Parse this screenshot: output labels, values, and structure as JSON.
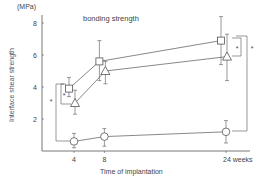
{
  "chart_data": {
    "type": "line",
    "title": "bonding strength",
    "xlabel": "Time of implantation",
    "ylabel": "Interface shear strength",
    "yunit": "(MPa)",
    "x": [
      4,
      8,
      24
    ],
    "x_tick_labels": [
      "4",
      "8",
      "24 weeks"
    ],
    "y_ticks": [
      2,
      4,
      6,
      8
    ],
    "ylim": [
      0,
      9
    ],
    "grid": false,
    "legend": "none (series distinguished by markers)",
    "series": [
      {
        "name": "square-marker",
        "marker": "square",
        "values": [
          3.9,
          5.6,
          6.9
        ],
        "err_hi": [
          4.6,
          6.9,
          8.4
        ],
        "err_lo": [
          3.4,
          4.4,
          5.4
        ]
      },
      {
        "name": "triangle-marker",
        "marker": "triangle",
        "values": [
          3.0,
          5.0,
          5.9
        ],
        "err_hi": [
          3.8,
          5.6,
          7.3
        ],
        "err_lo": [
          2.3,
          4.2,
          4.4
        ]
      },
      {
        "name": "circle-marker",
        "marker": "circle",
        "values": [
          0.6,
          0.9,
          1.2
        ],
        "err_hi": [
          1.1,
          1.4,
          1.9
        ],
        "err_lo": [
          0.2,
          0.3,
          0.5
        ]
      }
    ],
    "annotations": [
      "*",
      "*",
      "*",
      "*"
    ],
    "significance_brackets": [
      {
        "at": "4 weeks",
        "between": "square vs triangle",
        "label": "*"
      },
      {
        "at": "4 weeks",
        "between": "square vs circle",
        "label": "*"
      },
      {
        "at": "24 weeks",
        "between": "square vs triangle",
        "label": "*"
      },
      {
        "at": "24 weeks",
        "between": "square vs circle",
        "label": "*"
      }
    ]
  },
  "labels": {
    "unit": "(MPa)",
    "title": "bonding strength",
    "xlabel": "Time of implantation",
    "ylabel": "Interface shear strength",
    "star": "*"
  },
  "colors": {
    "line": "#555555",
    "text": "#444444"
  }
}
